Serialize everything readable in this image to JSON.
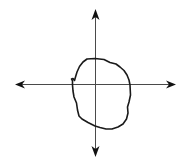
{
  "diagram": {
    "type": "coordinate-plane-with-closed-curve",
    "width": 190,
    "height": 164,
    "background": "#ffffff",
    "axis_color": "#4a4a4a",
    "curve_color": "#1a1a1a",
    "origin": {
      "x": 95,
      "y": 84
    },
    "axes": {
      "x_axis": {
        "from": {
          "x": 15,
          "y": 85
        },
        "to": {
          "x": 176,
          "y": 84
        },
        "arrows": [
          "left",
          "right"
        ]
      },
      "y_axis": {
        "from": {
          "x": 95,
          "y": 9
        },
        "to": {
          "x": 95,
          "y": 157
        },
        "arrows": [
          "up",
          "down"
        ]
      }
    },
    "curve": {
      "closed": true,
      "description": "irregular closed loop roughly centered right of origin, with a small hook on the left side near the x-axis",
      "path": "M 87 59 L 95 58.5 L 104 59.5 L 110 62.5 L 116 64 L 120 67 L 124 70.5 L 127 75 L 129 80 L 130 85 L 130.5 95 L 129 102 L 127.5 107 L 128 113 L 126.5 119 L 123 124 L 118 127 L 112 129 L 106 129 L 100 127.5 L 95 126 L 88 122.5 L 82 119 L 79 116 L 77.5 110 L 76.5 103 L 74 97 L 73 91 L 72.5 85 L 72.5 81 L 71.5 79 L 73 78.5 L 74.5 80.5 L 75.5 77 L 77 72 L 79.5 66.5 L 83 62 Z"
    },
    "labels": []
  }
}
